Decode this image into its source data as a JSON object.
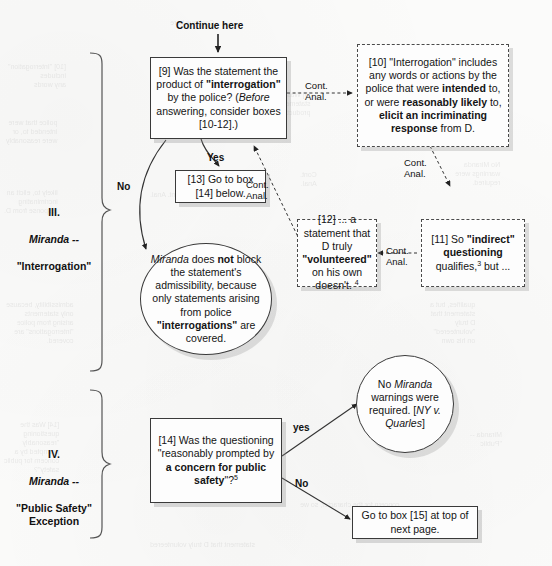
{
  "page": {
    "width": 552,
    "height": 566,
    "background": "#fbfbfa",
    "ink": "#141414"
  },
  "sections": [
    {
      "id": "section-iii",
      "numeral": "III.",
      "name": "Miranda --",
      "subtitle": "\"Interrogation\""
    },
    {
      "id": "section-iv",
      "numeral": "IV.",
      "name": "Miranda --",
      "subtitle": "\"Public Safety\"\nException"
    }
  ],
  "entry_label": "Continue here",
  "nodes": {
    "box9": {
      "id": "9",
      "shape": "rect-solid",
      "text_plain": "[9] Was the statement the product of \"interrogation\" by the police? (Before answering, consider boxes [10-12].)",
      "text_html": "[9] Was the statement the product of <b>\"interrogation\"</b> by the police? (<i>Before</i> answering, consider boxes [10-12].)"
    },
    "box10": {
      "id": "10",
      "shape": "rect-dashed",
      "text_plain": "[10] \"Interrogation\" includes any words or actions by the police that were intended to, or were reasonably likely to, elicit an incriminating response from D.",
      "text_html": "[10] \"Interrogation\" includes any words or actions by the police that were <b>intended</b> to, or were <b>reasonably likely</b> to, <b>elicit an incriminating response</b> from D."
    },
    "box11": {
      "id": "11",
      "shape": "rect-dashed",
      "text_plain": "[11] So \"indirect\" questioning qualifies,3 but ...",
      "text_html": "[11] So <b>\"indirect\" questioning</b> qualifies,<sup>3</sup> but ..."
    },
    "box12": {
      "id": "12",
      "shape": "rect-dashed",
      "text_plain": "[12] ... a statement that D truly \"volunteered\" on his own doesn't. 4",
      "text_html": "[12] ... a statement that D truly <b>\"volunteered\"</b> on his own doesn't. <sup>4</sup>"
    },
    "box13": {
      "id": "13",
      "shape": "rect-solid",
      "text_plain": "[13] Go to box [14] below.",
      "text_html": "[13] Go to box [14] below."
    },
    "oval_no_block": {
      "id": "miranda-does-not-block",
      "shape": "oval",
      "text_plain": "Miranda does not block the statement's admissibility, because only statements arising from police \"interrogations\" are covered.",
      "text_html": "<i>Miranda</i> does <b>not</b> block the statement's admissibility, because only statements arising from police <b>\"interrogations\"</b> are covered."
    },
    "box14": {
      "id": "14",
      "shape": "rect-solid",
      "text_plain": "[14] Was the questioning \"reasonably prompted by a concern for public safety\"?5",
      "text_html": "[14] Was the questioning \"reasonably prompted by <b>a concern for public safety</b>\"?<sup>5</sup>"
    },
    "oval_no_warnings": {
      "id": "no-warnings-required",
      "shape": "oval",
      "text_plain": "No Miranda warnings were required. [NY v. Quarles]",
      "text_html": "No <i>Miranda</i> warnings were required. [<i>NY v. Quarles</i>]"
    },
    "box15": {
      "id": "15",
      "shape": "rect-solid",
      "text_plain": "Go to box [15] at top of next page.",
      "text_html": "Go to box [15] at top of next page."
    }
  },
  "edge_labels": {
    "yes_from_9": "Yes",
    "no_from_9": "No",
    "cont_anal_9_to_10": "Cont.\nAnal.",
    "cont_anal_10_to_11": "Cont.\nAnal.",
    "cont_anal_11_to_12": "Cont.\nAnal.",
    "cont_anal_12_to_9": "Cont.\nAnal.",
    "yes_from_14": "yes",
    "no_from_14": "No"
  },
  "chart_data": {
    "type": "flowchart",
    "orientation": "top-down",
    "nodes": [
      {
        "key": "box9",
        "label": "[9] Was the statement the product of \"interrogation\" by the police?",
        "shape": "rect",
        "border": "solid"
      },
      {
        "key": "box10",
        "label": "[10] \"Interrogation\" includes any words or actions by the police ...",
        "shape": "rect",
        "border": "dashed"
      },
      {
        "key": "box11",
        "label": "[11] So \"indirect\" questioning qualifies, but ...",
        "shape": "rect",
        "border": "dashed"
      },
      {
        "key": "box12",
        "label": "[12] ... a statement that D truly \"volunteered\" on his own doesn't.",
        "shape": "rect",
        "border": "dashed"
      },
      {
        "key": "box13",
        "label": "[13] Go to box [14] below.",
        "shape": "rect",
        "border": "solid"
      },
      {
        "key": "oval_no_block",
        "label": "Miranda does not block the statement's admissibility ...",
        "shape": "oval",
        "border": "solid"
      },
      {
        "key": "box14",
        "label": "[14] Was the questioning \"reasonably prompted by a concern for public safety\"?",
        "shape": "rect",
        "border": "solid"
      },
      {
        "key": "oval_no_warnings",
        "label": "No Miranda warnings were required. [NY v. Quarles]",
        "shape": "oval",
        "border": "solid"
      },
      {
        "key": "box15",
        "label": "Go to box [15] at top of next page.",
        "shape": "rect",
        "border": "solid"
      }
    ],
    "edges": [
      {
        "from": "entry",
        "to": "box9",
        "label": "Continue here",
        "style": "solid"
      },
      {
        "from": "box9",
        "to": "box13",
        "label": "Yes",
        "style": "solid"
      },
      {
        "from": "box9",
        "to": "oval_no_block",
        "label": "No",
        "style": "solid"
      },
      {
        "from": "box9",
        "to": "box10",
        "label": "Cont. Anal.",
        "style": "dashed"
      },
      {
        "from": "box10",
        "to": "box11",
        "label": "Cont. Anal.",
        "style": "dashed"
      },
      {
        "from": "box11",
        "to": "box12",
        "label": "Cont. Anal.",
        "style": "dashed"
      },
      {
        "from": "box12",
        "to": "box9",
        "label": "Cont. Anal.",
        "style": "dashed"
      },
      {
        "from": "box14",
        "to": "oval_no_warnings",
        "label": "yes",
        "style": "solid"
      },
      {
        "from": "box14",
        "to": "box15",
        "label": "No",
        "style": "solid"
      }
    ],
    "groups": [
      {
        "label": "III. Miranda -- \"Interrogation\"",
        "members": [
          "box9",
          "box10",
          "box11",
          "box12",
          "box13",
          "oval_no_block"
        ]
      },
      {
        "label": "IV. Miranda -- \"Public Safety\" Exception",
        "members": [
          "box14",
          "oval_no_warnings",
          "box15"
        ]
      }
    ]
  }
}
